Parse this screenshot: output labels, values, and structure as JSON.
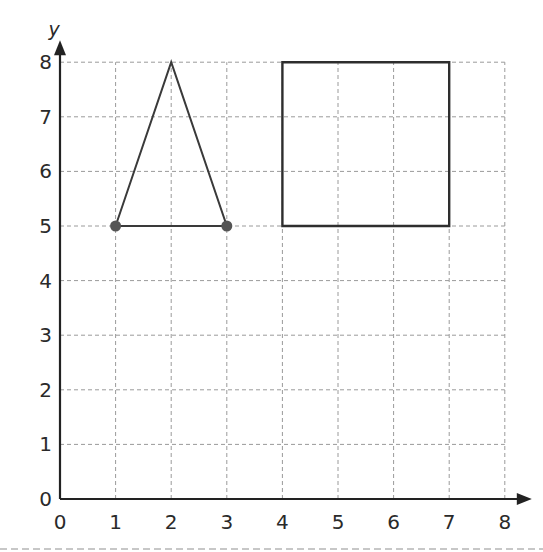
{
  "chart_data": {
    "type": "scatter",
    "title": "",
    "xlabel": "",
    "ylabel": "y",
    "xlim": [
      0,
      8
    ],
    "ylim": [
      0,
      8
    ],
    "x_ticks": [
      "0",
      "1",
      "2",
      "3",
      "4",
      "5",
      "6",
      "7",
      "8"
    ],
    "y_ticks": [
      "0",
      "1",
      "2",
      "3",
      "4",
      "5",
      "6",
      "7",
      "8"
    ],
    "grid": true,
    "grid_style": "dashed",
    "shapes": [
      {
        "name": "triangle",
        "kind": "polygon",
        "vertices": [
          [
            1,
            5
          ],
          [
            2,
            8
          ],
          [
            3,
            5
          ]
        ],
        "marked_points": [
          [
            1,
            5
          ],
          [
            3,
            5
          ]
        ]
      },
      {
        "name": "square",
        "kind": "polygon",
        "vertices": [
          [
            4,
            5
          ],
          [
            4,
            8
          ],
          [
            7,
            8
          ],
          [
            7,
            5
          ]
        ],
        "marked_points": []
      }
    ],
    "colors": {
      "axis": "#222222",
      "grid": "#9a9a9a",
      "shape_stroke": "#3a3a3a",
      "point_fill": "#555555"
    }
  },
  "layout": {
    "origin_px": [
      60,
      499
    ],
    "unit_x_px": 55.6,
    "unit_y_px": 54.6
  }
}
